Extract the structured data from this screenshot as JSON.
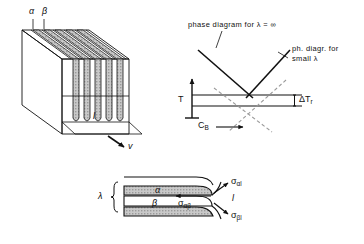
{
  "figure": {
    "background_color": "#ffffff",
    "ink_color": "#111111",
    "lamella_fill_color": "#bdbdbd",
    "width": 364,
    "height": 244
  },
  "panel_block": {
    "name": "three-dimensional lamellar block",
    "label_alpha": "α",
    "label_beta": "β",
    "label_spacing": "l",
    "label_velocity": "v",
    "lamellae_count": 5,
    "phases": [
      "α",
      "β"
    ]
  },
  "panel_phase_diagram": {
    "name": "phase diagram panel",
    "caption_infinite": "phase diagram for λ = ∞",
    "caption_small_1": "ph. diagr. for",
    "caption_small_2": "small λ",
    "axis_y_label": "T",
    "axis_x_label": "C",
    "axis_x_label_sub": "B",
    "axis_x_arrow": "→",
    "delta_label": "ΔT",
    "delta_label_sub": "r",
    "liquidus_style_infinite": "solid",
    "liquidus_style_small": "dashed"
  },
  "panel_interface": {
    "name": "lamella tip interfacial tension panel",
    "label_lambda": "λ",
    "label_alpha": "α",
    "label_beta": "β",
    "label_liquid": "l",
    "sigma_alpha_l": "σ",
    "sigma_alpha_l_sub": "αl",
    "sigma_alpha_beta": "σ",
    "sigma_alpha_beta_sub": "αβ",
    "sigma_beta_l": "σ",
    "sigma_beta_l_sub": "βl"
  }
}
